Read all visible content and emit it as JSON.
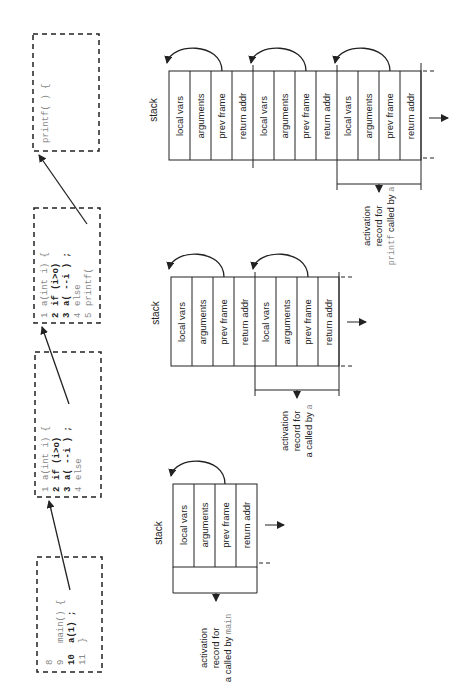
{
  "code_boxes": [
    {
      "id": "main",
      "lines": [
        {
          "num": "8",
          "text": "",
          "bold": false
        },
        {
          "num": "9",
          "text": "main()  {",
          "bold": false
        },
        {
          "num": "10",
          "text": "   a(1) ;",
          "bold": true
        },
        {
          "num": "11",
          "text": "}",
          "bold": false
        }
      ]
    },
    {
      "id": "a1",
      "lines": [
        {
          "num": "1",
          "text": "a(int i)  {",
          "bold": false
        },
        {
          "num": "2",
          "text": "if (i>o)",
          "bold": true
        },
        {
          "num": "3",
          "text": "   a( --i ) ;",
          "bold": true
        },
        {
          "num": "4",
          "text": "else",
          "bold": false
        }
      ]
    },
    {
      "id": "a2",
      "lines": [
        {
          "num": "1",
          "text": "a(int i)  {",
          "bold": false
        },
        {
          "num": "2",
          "text": "if (i>o)",
          "bold": true
        },
        {
          "num": "3",
          "text": "   a( --i ) ;",
          "bold": true
        },
        {
          "num": "4",
          "text": "else",
          "bold": false
        },
        {
          "num": "5",
          "text": "      printf(",
          "bold": false
        }
      ]
    },
    {
      "id": "printf",
      "lines": [
        {
          "num": "",
          "text": "printf( ) {",
          "bold": false
        }
      ]
    }
  ],
  "stacks": [
    {
      "label": "stack",
      "cells": [
        "local vars",
        "arguments",
        "prev frame",
        "return addr"
      ],
      "record": {
        "line1": "activation",
        "line2": "record for",
        "line3_prefix": "a called by ",
        "line3_code": "main"
      }
    },
    {
      "label": "stack",
      "cells": [
        "local vars",
        "arguments",
        "prev frame",
        "return addr",
        "local vars",
        "arguments",
        "prev frame",
        "return addr"
      ],
      "record": {
        "line1": "activation",
        "line2": "record for",
        "line3_prefix": "a called by ",
        "line3_code": "a"
      }
    },
    {
      "label": "stack",
      "cells": [
        "local vars",
        "arguments",
        "prev frame",
        "return addr",
        "local vars",
        "arguments",
        "prev frame",
        "return addr",
        "local vars",
        "arguments",
        "prev frame",
        "return addr"
      ],
      "record": {
        "line1": "activation",
        "line2": "record for",
        "line3_prefix": " called by ",
        "line3_code_first": "printf",
        "line3_code": "a"
      }
    }
  ]
}
